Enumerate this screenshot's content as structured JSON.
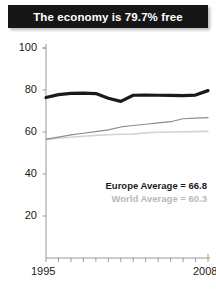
{
  "title": {
    "text": "The economy is 79.7% free"
  },
  "legend": {
    "europe_label": "Europe Average = 66.8",
    "world_label": "World Average = 60.3"
  },
  "colors": {
    "title_band": "#161616",
    "title_text": "#ffffff",
    "country_line": "#1a1a1a",
    "europe_line": "#8c8c8c",
    "world_line": "#d4d4d4",
    "axis": "#9a9a9a",
    "tick_text": "#1a1a1a"
  },
  "chart_data": {
    "type": "line",
    "title": "The economy is 79.7% free",
    "xlabel": "",
    "ylabel": "",
    "xlim": [
      1995,
      2008
    ],
    "ylim": [
      0,
      100
    ],
    "yticks": [
      20,
      40,
      60,
      80,
      100
    ],
    "xticks": [
      1995,
      2008
    ],
    "xtick_all": [
      1995,
      1996,
      1997,
      1998,
      1999,
      2000,
      2001,
      2002,
      2003,
      2004,
      2005,
      2006,
      2007,
      2008
    ],
    "grid": false,
    "legend_position": "inside-right",
    "x": [
      1995,
      1996,
      1997,
      1998,
      1999,
      2000,
      2001,
      2002,
      2003,
      2004,
      2005,
      2006,
      2007,
      2008
    ],
    "series": [
      {
        "name": "Country",
        "color": "#1a1a1a",
        "width": 3.2,
        "values": [
          76.4,
          77.8,
          78.4,
          78.5,
          78.3,
          76.1,
          74.6,
          77.5,
          77.6,
          77.5,
          77.4,
          77.3,
          77.6,
          79.7
        ]
      },
      {
        "name": "Europe Average",
        "color": "#8c8c8c",
        "width": 1.2,
        "values": [
          56.6,
          57.6,
          58.6,
          59.4,
          60.2,
          61.0,
          62.4,
          63.1,
          63.7,
          64.3,
          64.9,
          66.3,
          66.6,
          66.8
        ]
      },
      {
        "name": "World Average",
        "color": "#d4d4d4",
        "width": 1.6,
        "values": [
          56.3,
          57.0,
          57.5,
          58.0,
          58.4,
          58.7,
          58.9,
          59.0,
          59.6,
          59.9,
          60.0,
          60.1,
          60.2,
          60.3
        ]
      }
    ]
  }
}
